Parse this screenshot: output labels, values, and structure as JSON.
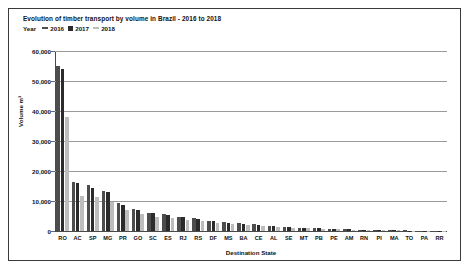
{
  "chart_data": {
    "type": "bar",
    "title": "Evolution of timber transport by volume in Brazil - 2016 to 2018",
    "legend_title": "Year",
    "legend_position": "top-left",
    "xlabel": "Destination State",
    "ylabel": "Volume m³",
    "ylim": [
      0,
      60000
    ],
    "yticks": [
      "0",
      "10,000",
      "20,000",
      "30,000",
      "40,000",
      "50,000",
      "60,000"
    ],
    "ytick_values": [
      0,
      10000,
      20000,
      30000,
      40000,
      50000,
      60000
    ],
    "grid": true,
    "categories": [
      "RO",
      "AC",
      "SP",
      "MG",
      "PR",
      "GO",
      "SC",
      "ES",
      "RJ",
      "RS",
      "DF",
      "MS",
      "BA",
      "CE",
      "AL",
      "SE",
      "MT",
      "PB",
      "PE",
      "AM",
      "RN",
      "PI",
      "MA",
      "TO",
      "PA",
      "RR"
    ],
    "series": [
      {
        "name": "2016",
        "color": "#4d4d4d",
        "values": [
          55000,
          16500,
          15500,
          13500,
          9200,
          7200,
          6100,
          5600,
          4800,
          4200,
          3500,
          3000,
          2600,
          2200,
          1700,
          1400,
          1100,
          900,
          700,
          600,
          450,
          350,
          250,
          180,
          120,
          80
        ]
      },
      {
        "name": "2017",
        "color": "#2b2b2b",
        "values": [
          54000,
          16000,
          14500,
          13000,
          8800,
          7000,
          5900,
          5300,
          4600,
          4000,
          3300,
          2800,
          2500,
          2100,
          1600,
          1300,
          1050,
          850,
          650,
          550,
          420,
          330,
          230,
          170,
          110,
          70
        ]
      },
      {
        "name": "2018",
        "color": "#bdbdbd",
        "values": [
          38000,
          11800,
          11500,
          9800,
          7000,
          5600,
          4800,
          4400,
          3800,
          3300,
          2800,
          2400,
          2000,
          1700,
          1300,
          1100,
          880,
          700,
          550,
          450,
          350,
          270,
          190,
          140,
          90,
          60
        ]
      }
    ]
  }
}
